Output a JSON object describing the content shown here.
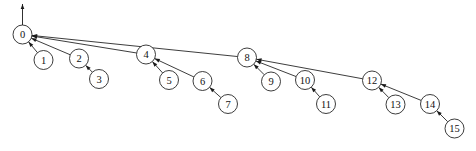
{
  "figure": {
    "type": "binomial-tree-diagram",
    "canvas": {
      "width": 476,
      "height": 151
    },
    "background_color": "#ffffff",
    "stroke_color": "#1a1a1a",
    "node_fill_color": "#ffffff",
    "label_color": "#111111",
    "node_radius": 9.5,
    "edge_direction": "child-to-parent"
  },
  "root_pointer": {
    "name": "root-entry-arrow",
    "from": {
      "x": 22.5,
      "y": 25
    },
    "to": {
      "x": 22.5,
      "y": 4
    },
    "direction": "up"
  },
  "nodes": [
    {
      "id": 0,
      "label": "0",
      "x": 22.5,
      "y": 34.5
    },
    {
      "id": 1,
      "label": "1",
      "x": 43.5,
      "y": 60.0
    },
    {
      "id": 2,
      "label": "2",
      "x": 79.0,
      "y": 58.5
    },
    {
      "id": 3,
      "label": "3",
      "x": 99.0,
      "y": 79.0
    },
    {
      "id": 4,
      "label": "4",
      "x": 146.0,
      "y": 54.5
    },
    {
      "id": 5,
      "label": "5",
      "x": 169.0,
      "y": 80.0
    },
    {
      "id": 6,
      "label": "6",
      "x": 202.5,
      "y": 81.0
    },
    {
      "id": 7,
      "label": "7",
      "x": 228.0,
      "y": 104.0
    },
    {
      "id": 8,
      "label": "8",
      "x": 247.0,
      "y": 57.5
    },
    {
      "id": 9,
      "label": "9",
      "x": 271.0,
      "y": 81.5
    },
    {
      "id": 10,
      "label": "10",
      "x": 305.0,
      "y": 80.0
    },
    {
      "id": 11,
      "label": "11",
      "x": 326.0,
      "y": 104.0
    },
    {
      "id": 12,
      "label": "12",
      "x": 372.0,
      "y": 80.5
    },
    {
      "id": 13,
      "label": "13",
      "x": 395.5,
      "y": 104.5
    },
    {
      "id": 14,
      "label": "14",
      "x": 430.0,
      "y": 104.0
    },
    {
      "id": 15,
      "label": "15",
      "x": 454.5,
      "y": 128.5
    }
  ],
  "edges": [
    {
      "from": 1,
      "to": 0,
      "name": "edge-1-to-0"
    },
    {
      "from": 2,
      "to": 0,
      "name": "edge-2-to-0"
    },
    {
      "from": 3,
      "to": 2,
      "name": "edge-3-to-2"
    },
    {
      "from": 4,
      "to": 0,
      "name": "edge-4-to-0"
    },
    {
      "from": 5,
      "to": 4,
      "name": "edge-5-to-4"
    },
    {
      "from": 6,
      "to": 4,
      "name": "edge-6-to-4"
    },
    {
      "from": 7,
      "to": 6,
      "name": "edge-7-to-6"
    },
    {
      "from": 8,
      "to": 0,
      "name": "edge-8-to-0"
    },
    {
      "from": 9,
      "to": 8,
      "name": "edge-9-to-8"
    },
    {
      "from": 10,
      "to": 8,
      "name": "edge-10-to-8"
    },
    {
      "from": 11,
      "to": 10,
      "name": "edge-11-to-10"
    },
    {
      "from": 12,
      "to": 8,
      "name": "edge-12-to-8"
    },
    {
      "from": 13,
      "to": 12,
      "name": "edge-13-to-12"
    },
    {
      "from": 14,
      "to": 12,
      "name": "edge-14-to-12"
    },
    {
      "from": 15,
      "to": 14,
      "name": "edge-15-to-14"
    }
  ]
}
